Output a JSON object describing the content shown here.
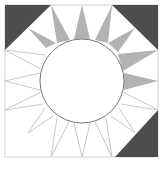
{
  "diagram": {
    "type": "quilt-block",
    "name": "Sun / Mariner's compass block",
    "frame": {
      "x": 5,
      "y": 5,
      "width": 153,
      "height": 152
    },
    "center": {
      "cx": 82,
      "cy": 81,
      "r": 42
    },
    "colors": {
      "background": "#ffffff",
      "dark_corner": "#4d4d4d",
      "ray_fill": "#b3b3b3",
      "ray_outline": "#c8c8c8",
      "circle_stroke": "#777777",
      "frame_stroke": "#d0d0d0"
    },
    "dark_corners": [
      {
        "id": "top-left",
        "points": "5,5 51,5 5,50"
      },
      {
        "id": "top-right",
        "points": "112,5 158,5 158,50"
      },
      {
        "id": "bottom-right",
        "points": "158,110 158,157 115,157"
      }
    ],
    "filled_rays": [
      {
        "id": "ray-nw",
        "points": "28,28 46,48 56,43"
      },
      {
        "id": "ray-nnw",
        "points": "51,5 57,43 70,40"
      },
      {
        "id": "ray-n",
        "points": "82,5 74,39 90,39"
      },
      {
        "id": "ray-nne",
        "points": "112,5 95,40 108,43"
      },
      {
        "id": "ray-ne",
        "points": "135,28 108,43 118,52"
      },
      {
        "id": "ray-ene",
        "points": "158,50 118,54 123,71"
      },
      {
        "id": "ray-e",
        "points": "158,81 124,73 124,90"
      }
    ],
    "outline_rays": [
      {
        "id": "ray-ese",
        "tip": [
          158,
          110
        ],
        "base": [
          [
            123,
            92
          ],
          [
            121,
            104
          ]
        ]
      },
      {
        "id": "ray-se",
        "tip": [
          135,
          133
        ],
        "base": [
          [
            119,
            108
          ],
          [
            111,
            116
          ]
        ]
      },
      {
        "id": "ray-sse",
        "tip": [
          112,
          157
        ],
        "base": [
          [
            106,
            118
          ],
          [
            95,
            122
          ]
        ]
      },
      {
        "id": "ray-s",
        "tip": [
          82,
          157
        ],
        "base": [
          [
            90,
            123
          ],
          [
            74,
            123
          ]
        ]
      },
      {
        "id": "ray-ssw",
        "tip": [
          51,
          157
        ],
        "base": [
          [
            69,
            122
          ],
          [
            57,
            118
          ]
        ]
      },
      {
        "id": "ray-sw",
        "tip": [
          28,
          133
        ],
        "base": [
          [
            53,
            116
          ],
          [
            45,
            108
          ]
        ]
      },
      {
        "id": "ray-wsw",
        "tip": [
          5,
          110
        ],
        "base": [
          [
            43,
            104
          ],
          [
            41,
            92
          ]
        ]
      },
      {
        "id": "ray-w",
        "tip": [
          5,
          81
        ],
        "base": [
          [
            40,
            90
          ],
          [
            40,
            73
          ]
        ]
      },
      {
        "id": "ray-wnw",
        "tip": [
          5,
          50
        ],
        "base": [
          [
            41,
            69
          ],
          [
            45,
            55
          ]
        ]
      }
    ]
  }
}
